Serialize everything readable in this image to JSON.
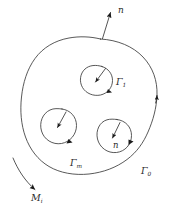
{
  "figure": {
    "background_color": "#ffffff",
    "stroke_color": "#3b3b3b",
    "width": 172,
    "height": 219
  },
  "labels": {
    "outer_normal": {
      "text": "n",
      "subscript": ""
    },
    "outer_boundary": {
      "text": "Γ",
      "subscript": "0"
    },
    "hole_top": {
      "text": "Γ",
      "subscript": "1"
    },
    "hole_left": {
      "text": "Γ",
      "subscript": "m"
    },
    "hole_bottom_normal": {
      "text": "n",
      "subscript": ""
    },
    "exterior_point": {
      "text": "M",
      "subscript": "i"
    }
  },
  "elements": {
    "outer_contour_name": "outer-boundary-contour",
    "holes": [
      {
        "name": "hole-top",
        "label_key": "hole_top"
      },
      {
        "name": "hole-left",
        "label_key": "hole_left"
      },
      {
        "name": "hole-bottom-right",
        "label_key": "hole_bottom_normal"
      }
    ],
    "normals": [
      {
        "name": "outer-normal-arrow",
        "direction": "outward"
      },
      {
        "name": "outer-boundary-orientation-arrow",
        "direction": "counterclockwise"
      },
      {
        "name": "hole-top-normal-arrow",
        "direction": "inward"
      },
      {
        "name": "hole-left-normal-arrow",
        "direction": "inward"
      },
      {
        "name": "hole-bottom-normal-arrow",
        "direction": "inward"
      }
    ],
    "exterior_arrow_name": "exterior-point-arrow"
  }
}
